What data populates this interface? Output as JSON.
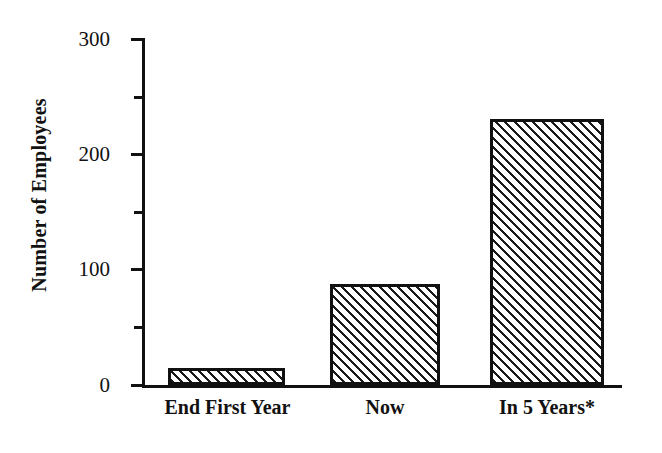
{
  "chart_data": {
    "type": "bar",
    "title": "",
    "subtitle": "",
    "xlabel": "",
    "ylabel": "Number of Employees",
    "categories": [
      "End First Year",
      "Now",
      "In 5 Years*"
    ],
    "values": [
      15,
      88,
      231
    ],
    "ylim": [
      0,
      300
    ],
    "y_major_ticks": [
      0,
      100,
      200,
      300
    ],
    "y_minor_ticks": [
      50,
      150,
      250
    ],
    "y_tick_labels": [
      "0",
      "100",
      "200",
      "300"
    ],
    "grid": false,
    "legend": false,
    "series": [
      {
        "name": "Number of Employees",
        "values": [
          15,
          88,
          231
        ],
        "fill": "diagonal-hatch",
        "fill_color": "#1a1a1a",
        "edge_color": "#111111"
      }
    ],
    "annotations": [
      "* projected"
    ],
    "colors": {
      "axis": "#111111",
      "text": "#111111",
      "background": "#ffffff",
      "hatch": "#1a1a1a"
    }
  },
  "axis": {
    "y_title": "Number of Employees",
    "ticks": [
      {
        "label": "300",
        "value": 300,
        "kind": "major"
      },
      {
        "label": "",
        "value": 250,
        "kind": "minor"
      },
      {
        "label": "200",
        "value": 200,
        "kind": "major"
      },
      {
        "label": "",
        "value": 150,
        "kind": "minor"
      },
      {
        "label": "100",
        "value": 100,
        "kind": "major"
      },
      {
        "label": "",
        "value": 50,
        "kind": "minor"
      },
      {
        "label": "0",
        "value": 0,
        "kind": "major"
      }
    ]
  },
  "bars": [
    {
      "label": "End First Year",
      "value": 15
    },
    {
      "label": "Now",
      "value": 88
    },
    {
      "label": "In 5 Years*",
      "value": 231
    }
  ]
}
